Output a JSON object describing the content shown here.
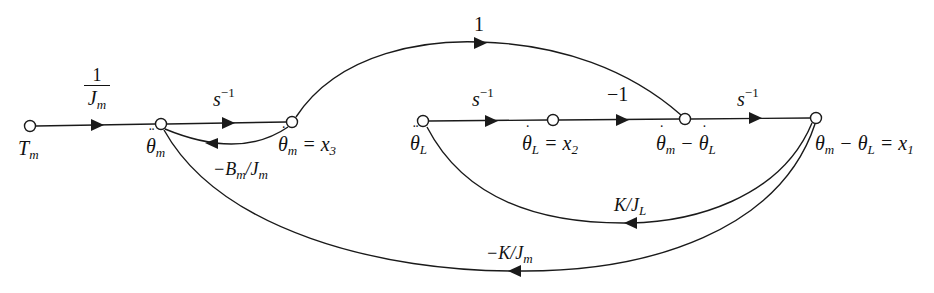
{
  "figure": {
    "type": "signal-flow-graph",
    "line_color": "#1a1a1a",
    "background": "#ffffff"
  },
  "nodes": [
    {
      "id": "Tm",
      "label": "T",
      "sub": "m",
      "accent": "",
      "suffix": ""
    },
    {
      "id": "theta_m_ddot",
      "label": "θ",
      "sub": "m",
      "accent": "¨",
      "suffix": ""
    },
    {
      "id": "theta_m_dot",
      "label": "θ",
      "sub": "m",
      "accent": "˙",
      "suffix": " = x",
      "suffix_sub": "3"
    },
    {
      "id": "theta_L_ddot",
      "label": "θ",
      "sub": "L",
      "accent": "¨",
      "suffix": ""
    },
    {
      "id": "theta_L_dot",
      "label": "θ",
      "sub": "L",
      "accent": "˙",
      "suffix": " = x",
      "suffix_sub": "2"
    },
    {
      "id": "diff_dot",
      "label": "θ",
      "sub": "m",
      "accent": "˙",
      "suffix": " − θ",
      "suffix_sub": "L",
      "suffix_accent": "˙"
    },
    {
      "id": "x1",
      "label": "θ",
      "sub": "m",
      "accent": "",
      "suffix": " − θ",
      "suffix_sub": "L",
      "tail": " = x",
      "tail_sub": "1"
    }
  ],
  "branches": [
    {
      "from": "Tm",
      "to": "theta_m_ddot",
      "gain": "1/Jm",
      "gain_num": "1",
      "gain_den": "J",
      "gain_den_sub": "m"
    },
    {
      "from": "theta_m_ddot",
      "to": "theta_m_dot",
      "gain": "s^-1",
      "base": "s",
      "sup": "−1"
    },
    {
      "from": "theta_m_dot",
      "to": "theta_m_ddot",
      "gain": "-Bm/Jm",
      "pre": "−B",
      "pre_sub": "m",
      "post": "/J",
      "post_sub": "m"
    },
    {
      "from": "theta_m_dot",
      "to": "diff_dot",
      "gain": "1",
      "text": "1"
    },
    {
      "from": "theta_L_ddot",
      "to": "theta_L_dot",
      "gain": "s^-1",
      "base": "s",
      "sup": "−1"
    },
    {
      "from": "theta_L_dot",
      "to": "diff_dot",
      "gain": "-1",
      "text": "−1"
    },
    {
      "from": "diff_dot",
      "to": "x1",
      "gain": "s^-1",
      "base": "s",
      "sup": "−1"
    },
    {
      "from": "x1",
      "to": "theta_L_ddot",
      "gain": "K/JL",
      "pre": "K/J",
      "pre_sub": "L"
    },
    {
      "from": "x1",
      "to": "theta_m_ddot",
      "gain": "-K/Jm",
      "pre": "−K/J",
      "pre_sub": "m"
    }
  ]
}
